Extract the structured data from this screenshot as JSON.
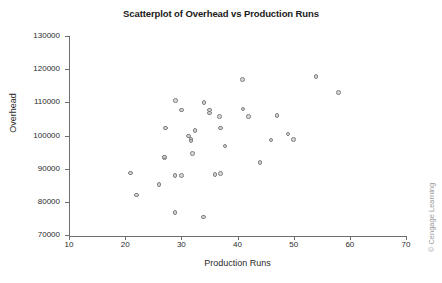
{
  "chart_data": {
    "type": "scatter",
    "title": "Scatterplot of Overhead vs Production Runs",
    "xlabel": "Production Runs",
    "ylabel": "Overhead",
    "xlim": [
      10,
      70
    ],
    "ylim": [
      70000,
      130000
    ],
    "xticks": [
      10,
      20,
      30,
      40,
      50,
      60,
      70
    ],
    "yticks": [
      70000,
      80000,
      90000,
      100000,
      110000,
      120000,
      130000
    ],
    "xtick_labels": [
      "10",
      "20",
      "30",
      "40",
      "50",
      "60",
      "70"
    ],
    "ytick_labels": [
      "70000",
      "80000",
      "90000",
      "100000",
      "110000",
      "120000",
      "130000"
    ],
    "grid": false,
    "legend": null,
    "marker": {
      "shape": "circle",
      "fill": "#d7d7d7",
      "edge": "#808080",
      "size": 4.6
    },
    "points": [
      {
        "x": 21.0,
        "y": 88700
      },
      {
        "x": 22.0,
        "y": 82100
      },
      {
        "x": 26.0,
        "y": 85300
      },
      {
        "x": 27.0,
        "y": 93300
      },
      {
        "x": 27.0,
        "y": 93500
      },
      {
        "x": 27.2,
        "y": 102300
      },
      {
        "x": 28.9,
        "y": 76800
      },
      {
        "x": 28.9,
        "y": 87900
      },
      {
        "x": 29.0,
        "y": 110500
      },
      {
        "x": 30.0,
        "y": 87900
      },
      {
        "x": 30.0,
        "y": 107700
      },
      {
        "x": 31.3,
        "y": 99800
      },
      {
        "x": 31.7,
        "y": 98800
      },
      {
        "x": 31.7,
        "y": 98300
      },
      {
        "x": 32.0,
        "y": 94600
      },
      {
        "x": 32.4,
        "y": 101500
      },
      {
        "x": 33.9,
        "y": 75400
      },
      {
        "x": 34.0,
        "y": 110000
      },
      {
        "x": 35.0,
        "y": 107700
      },
      {
        "x": 35.0,
        "y": 106800
      },
      {
        "x": 36.0,
        "y": 88200
      },
      {
        "x": 36.8,
        "y": 105700
      },
      {
        "x": 37.0,
        "y": 88600
      },
      {
        "x": 37.0,
        "y": 102300
      },
      {
        "x": 37.8,
        "y": 96800
      },
      {
        "x": 40.9,
        "y": 116900
      },
      {
        "x": 41.0,
        "y": 108000
      },
      {
        "x": 42.0,
        "y": 105700
      },
      {
        "x": 44.0,
        "y": 91800
      },
      {
        "x": 46.0,
        "y": 98700
      },
      {
        "x": 47.0,
        "y": 106000
      },
      {
        "x": 49.0,
        "y": 100500
      },
      {
        "x": 50.0,
        "y": 98800
      },
      {
        "x": 54.0,
        "y": 117700
      },
      {
        "x": 58.0,
        "y": 112900
      }
    ]
  },
  "credit": "© Cengage Learning"
}
